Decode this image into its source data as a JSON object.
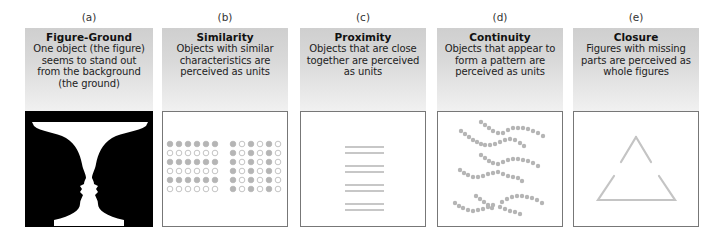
{
  "panels": [
    {
      "letter": "(a)",
      "title": "Figure-Ground",
      "description": "One object (the figure) seems to stand out from the background (the ground)",
      "illustration": "vase-faces-illusion"
    },
    {
      "letter": "(b)",
      "title": "Similarity",
      "description": "Objects with similar characteristics are perceived as units",
      "illustration": "dot-grids-filled-and-hollow"
    },
    {
      "letter": "(c)",
      "title": "Proximity",
      "description": "Objects that are close together are perceived as units",
      "illustration": "paired-horizontal-lines"
    },
    {
      "letter": "(d)",
      "title": "Continuity",
      "description": "Objects that appear to form a pattern are perceived as units",
      "illustration": "wavy-dot-lines"
    },
    {
      "letter": "(e)",
      "title": "Closure",
      "description": "Figures with missing parts are perceived as whole figures",
      "illustration": "broken-triangle"
    }
  ],
  "colors": {
    "header_top": "#cfcfcf",
    "header_bottom": "#f1f1f1",
    "box_border": "#777777",
    "element_gray": "#b5b5b5",
    "figure_ground_black": "#000000",
    "figure_ground_white": "#ffffff"
  }
}
